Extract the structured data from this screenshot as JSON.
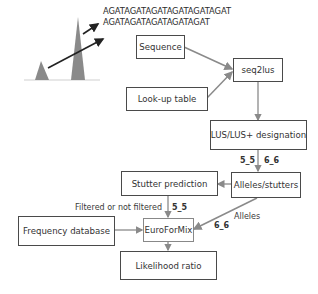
{
  "sequences": {
    "long": "AGATAGATAGATAGATAGATAGAT",
    "short": "AGATAGATAGATAGATAGAT"
  },
  "boxes": {
    "sequence": "Sequence",
    "seq2lus": "seq2lus",
    "lookup_table": "Look-up table",
    "lus_designation": "LUS/LUS+ designation",
    "alleles_stutters": "Alleles/stutters",
    "stutter_prediction": "Stutter prediction",
    "frequency_database": "Frequency database",
    "euroformix": "EuroForMix",
    "likelihood_ratio": "Likelihood ratio"
  },
  "edge_labels": {
    "lus_to_alleles_left": "5_5",
    "lus_to_alleles_right": "6_6",
    "filtered": "Filtered or not filtered",
    "stutter_to_efm": "5_5",
    "alleles": "Alleles",
    "alleles_to_efm": "6_6"
  },
  "colors": {
    "peak_fill": "#8a8a8a",
    "line": "#8a8a8a",
    "box_border": "#4a4a4a"
  }
}
